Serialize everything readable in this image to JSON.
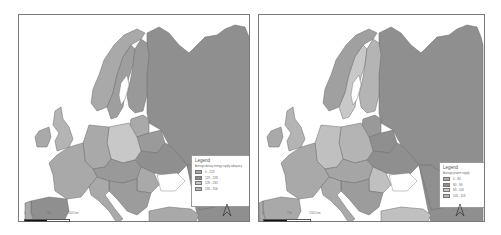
{
  "maps": [
    {
      "id": "map-1",
      "legend": {
        "title": "Legend",
        "subtitle": "Average dietary energy supply adequacy",
        "classes": [
          {
            "label": "0 - 123",
            "color": "#a9a9a9"
          },
          {
            "label": "123 - 128",
            "color": "#8f8f8f"
          },
          {
            "label": "128 - 135",
            "color": "#c8c8c8"
          },
          {
            "label": "135 - 156",
            "color": "#b4b4b4"
          }
        ]
      },
      "scale_bar": {
        "ticks": [
          "0",
          "750",
          "1500 km"
        ]
      }
    },
    {
      "id": "map-2",
      "legend": {
        "title": "Legend",
        "subtitle": "Average protein supply",
        "classes": [
          {
            "label": "0 - 80",
            "color": "#a9a9a9"
          },
          {
            "label": "80 - 93",
            "color": "#8f8f8f"
          },
          {
            "label": "93 - 105",
            "color": "#c8c8c8"
          },
          {
            "label": "105 - 113",
            "color": "#b4b4b4"
          }
        ]
      },
      "scale_bar": {
        "ticks": [
          "0",
          "750",
          "1500 km"
        ]
      }
    }
  ],
  "region_colors": {
    "map-1": {
      "russia": "#8f8f8f",
      "norway": "#a9a9a9",
      "sweden": "#9e9e9e",
      "finland": "#999999",
      "uk": "#b4b4b4",
      "ireland": "#a9a9a9",
      "france": "#a9a9a9",
      "spain": "#8f8f8f",
      "portugal": "#a9a9a9",
      "germany": "#a9a9a9",
      "poland": "#c8c8c8",
      "italy": "#a9a9a9",
      "ukraine": "#8f8f8f",
      "belarus": "#9a9a9a",
      "baltics": "#a9a9a9",
      "balkans": "#9c9c9c",
      "romania": "#a9a9a9",
      "turkey": "#a9a9a9",
      "central": "#999999",
      "kazakh": "#8f8f8f"
    },
    "map-2": {
      "russia": "#8f8f8f",
      "norway": "#a0a0a0",
      "sweden": "#c8c8c8",
      "finland": "#b4b4b4",
      "uk": "#b4b4b4",
      "ireland": "#a9a9a9",
      "france": "#a9a9a9",
      "spain": "#a9a9a9",
      "portugal": "#a9a9a9",
      "germany": "#c0c0c0",
      "poland": "#b4b4b4",
      "italy": "#a9a9a9",
      "ukraine": "#8f8f8f",
      "belarus": "#8f8f8f",
      "baltics": "#999999",
      "balkans": "#9c9c9c",
      "romania": "#c0c0c0",
      "turkey": "#c0c0c0",
      "central": "#a5a5a5",
      "kazakh": "#8f8f8f"
    }
  }
}
